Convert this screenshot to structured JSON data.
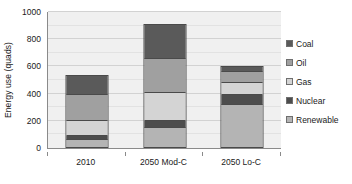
{
  "chart_data": {
    "type": "bar",
    "subtype": "stacked-column",
    "title": "",
    "subtitle": "",
    "xlabel": "",
    "ylabel": "Energy use  (quads)",
    "categories": [
      "2010",
      "2050 Mod-C",
      "2050 Lo-C"
    ],
    "series": [
      {
        "name": "Renewable",
        "color": "#b4b4b4",
        "values": [
          55,
          140,
          320
        ]
      },
      {
        "name": "Nuclear",
        "color": "#4d4d4d",
        "values": [
          25,
          55,
          70
        ]
      },
      {
        "name": "Gas",
        "color": "#d4d4d4",
        "values": [
          115,
          210,
          90
        ]
      },
      {
        "name": "Oil",
        "color": "#a0a0a0",
        "values": [
          200,
          255,
          85
        ]
      },
      {
        "name": "Coal",
        "color": "#5a5a5a",
        "values": [
          140,
          255,
          35
        ]
      }
    ],
    "stack_order_bottom_to_top": [
      "Renewable",
      "Nuclear",
      "Gas",
      "Oil",
      "Coal"
    ],
    "totals": [
      535,
      915,
      600
    ],
    "ylim": [
      0,
      1000
    ],
    "y_major_ticks": [
      0,
      200,
      400,
      600,
      800,
      1000
    ],
    "y_minor_ticks": [
      100,
      300,
      500,
      700,
      900
    ],
    "y_tick_labels": [
      "0",
      "200",
      "400",
      "600",
      "800",
      "1000"
    ],
    "grid": true,
    "grid_axis": "y",
    "legend_position": "right",
    "plot_background": "#f0f0f0",
    "axis_color": "#8a8a8a",
    "bar_outline_color": "#4a4a4a"
  },
  "legend": {
    "items": [
      {
        "label": "Coal",
        "color": "#5a5a5a"
      },
      {
        "label": "Oil",
        "color": "#a0a0a0"
      },
      {
        "label": "Gas",
        "color": "#d4d4d4"
      },
      {
        "label": "Nuclear",
        "color": "#4d4d4d"
      },
      {
        "label": "Renewable",
        "color": "#b4b4b4"
      }
    ]
  }
}
